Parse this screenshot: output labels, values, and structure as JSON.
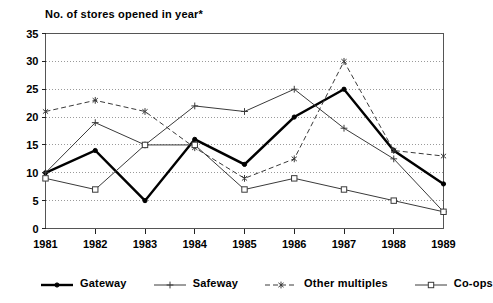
{
  "chart_data": {
    "type": "line",
    "title": "No. of stores opened in year*",
    "xlabel": "",
    "ylabel": "",
    "x": [
      "1981",
      "1982",
      "1983",
      "1984",
      "1985",
      "1986",
      "1987",
      "1988",
      "1989"
    ],
    "categories": [
      "1981",
      "1982",
      "1983",
      "1984",
      "1985",
      "1986",
      "1987",
      "1988",
      "1989"
    ],
    "ylim": [
      0,
      35
    ],
    "ytick_labels": [
      "0",
      "5",
      "10",
      "15",
      "20",
      "25",
      "30",
      "35"
    ],
    "ytick_values": [
      0,
      5,
      10,
      15,
      20,
      25,
      30,
      35
    ],
    "grid": "horizontal-dotted",
    "legend_position": "bottom",
    "series": [
      {
        "name": "Gateway",
        "marker": "dot",
        "line_style": "solid",
        "line_width": 2.4,
        "color": "#000000",
        "values": [
          10,
          14,
          5,
          16,
          11.5,
          20,
          25,
          14,
          8
        ]
      },
      {
        "name": "Safeway",
        "marker": "plus",
        "line_style": "solid",
        "line_width": 1,
        "color": "#3a3a3a",
        "values": [
          10,
          19,
          15,
          22,
          21,
          25,
          18,
          12.5,
          3
        ]
      },
      {
        "name": "Other multiples",
        "marker": "asterisk",
        "line_style": "dashed",
        "line_width": 1,
        "color": "#3a3a3a",
        "values": [
          21,
          23,
          21,
          14.5,
          9,
          12.5,
          30,
          14,
          13
        ]
      },
      {
        "name": "Co-ops",
        "marker": "square",
        "line_style": "solid",
        "line_width": 1,
        "color": "#3a3a3a",
        "values": [
          9,
          7,
          15,
          15,
          7,
          9,
          7,
          5,
          3
        ]
      }
    ]
  },
  "legend": {
    "items": [
      {
        "label": "Gateway"
      },
      {
        "label": "Safeway"
      },
      {
        "label": "Other multiples"
      },
      {
        "label": "Co-ops"
      }
    ]
  }
}
